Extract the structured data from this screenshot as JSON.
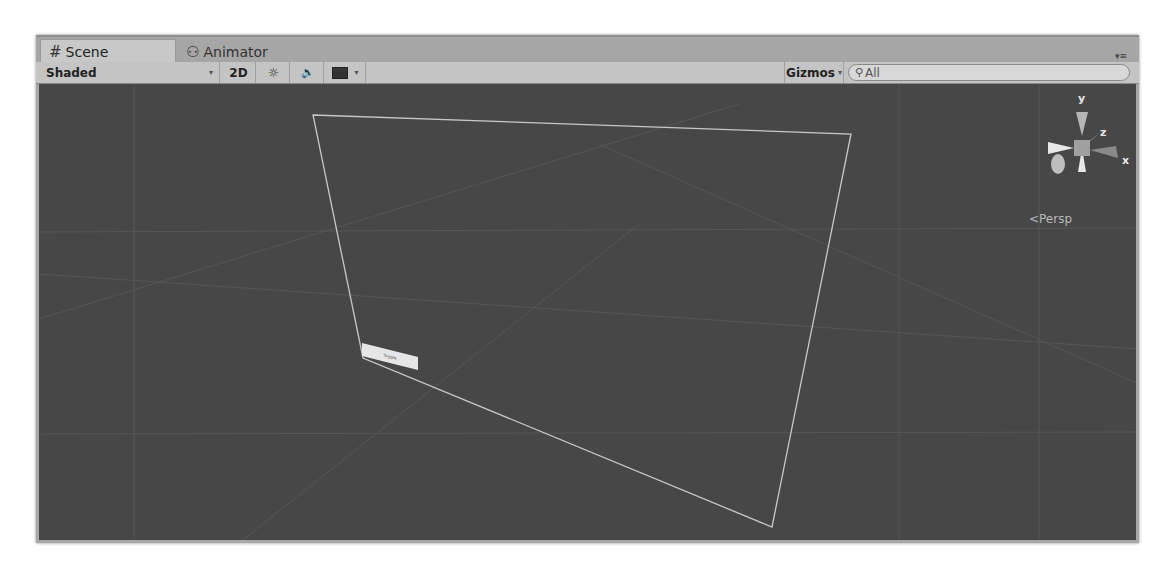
{
  "tabs": [
    {
      "label": "Scene",
      "icon": "grid-hash-icon",
      "glyph": "#",
      "active": true
    },
    {
      "label": "Animator",
      "icon": "animator-nodes-icon",
      "glyph": "⚇",
      "active": false
    }
  ],
  "window_menu": {
    "glyph": "▾≡"
  },
  "toolbar": {
    "draw_mode": "Shaded",
    "dropdown_glyph": "▾",
    "toggle_2d": "2D",
    "lighting_glyph": "☼",
    "audio_glyph": "🔈",
    "effects_glyph": "▬",
    "gizmos": "Gizmos",
    "search_placeholder": "All",
    "search_glyph": "⚲"
  },
  "scene": {
    "background_color": "#474747",
    "object_label": "Toggle",
    "projection_label": "Persp",
    "projection_glyph": "<",
    "axes": {
      "y": "y",
      "z": "z",
      "x": "x"
    }
  }
}
